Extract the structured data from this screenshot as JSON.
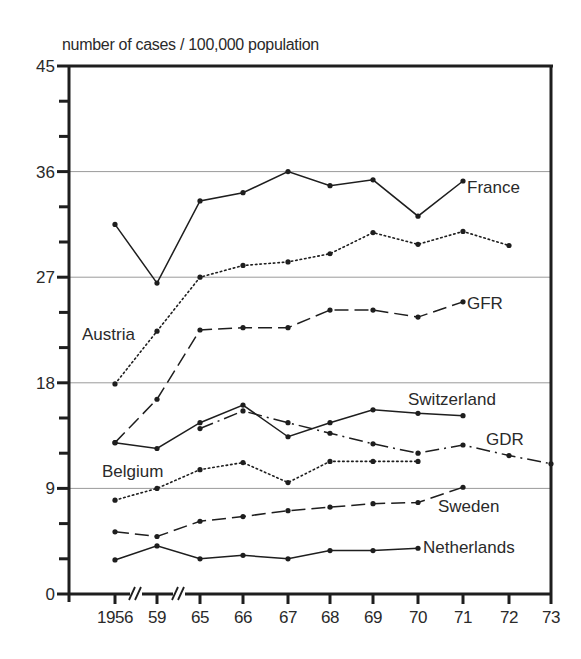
{
  "chart_data": {
    "type": "line",
    "title": "",
    "ylabel": "number of cases / 100,000 population",
    "xlabel": "",
    "ylim": [
      0,
      45
    ],
    "yticks": [
      0,
      9,
      18,
      27,
      36,
      45
    ],
    "y_minor_step": 3,
    "grid_lines_y": [
      9,
      18,
      27,
      36
    ],
    "x": [
      "1956",
      "59",
      "65",
      "66",
      "67",
      "68",
      "69",
      "70",
      "71",
      "72",
      "73"
    ],
    "x_breaks_after": [
      "1956",
      "59"
    ],
    "legend": "inline labels",
    "series": [
      {
        "name": "France",
        "style": "solid",
        "values": [
          31.5,
          26.5,
          33.5,
          34.2,
          36.0,
          34.8,
          35.3,
          32.2,
          35.2,
          null,
          null
        ]
      },
      {
        "name": "Austria",
        "style": "dotted",
        "values": [
          17.9,
          22.4,
          27.0,
          28.0,
          28.3,
          29.0,
          30.8,
          29.8,
          30.9,
          29.7,
          null
        ]
      },
      {
        "name": "GFR",
        "style": "dashed",
        "values": [
          12.9,
          16.6,
          22.5,
          22.7,
          22.7,
          24.2,
          24.2,
          23.6,
          24.9,
          null,
          null
        ]
      },
      {
        "name": "Switzerland",
        "style": "solid",
        "values": [
          12.9,
          12.4,
          14.6,
          16.1,
          13.4,
          14.6,
          15.7,
          15.4,
          15.2,
          null,
          null
        ]
      },
      {
        "name": "GDR",
        "style": "dash-dot",
        "values": [
          null,
          null,
          14.1,
          15.6,
          14.6,
          13.7,
          12.8,
          12.0,
          12.7,
          11.8,
          11.1
        ]
      },
      {
        "name": "Belgium",
        "style": "dotted",
        "values": [
          8.0,
          9.0,
          10.6,
          11.2,
          9.5,
          11.3,
          11.3,
          11.3,
          null,
          null,
          null
        ]
      },
      {
        "name": "Sweden",
        "style": "dashed",
        "values": [
          5.3,
          4.9,
          6.2,
          6.6,
          7.1,
          7.4,
          7.7,
          7.8,
          9.1,
          null,
          null
        ]
      },
      {
        "name": "Netherlands",
        "style": "solid",
        "values": [
          2.9,
          4.1,
          3.0,
          3.3,
          3.0,
          3.7,
          3.7,
          3.9,
          null,
          null,
          null
        ]
      }
    ]
  },
  "labels": {
    "ylabel": "number of cases / 100,000 population",
    "series": [
      {
        "name": "France",
        "x": 467,
        "y": 193
      },
      {
        "name": "Austria",
        "x": 82,
        "y": 340
      },
      {
        "name": "GFR",
        "x": 467,
        "y": 309
      },
      {
        "name": "Switzerland",
        "x": 408,
        "y": 405
      },
      {
        "name": "GDR",
        "x": 486,
        "y": 445
      },
      {
        "name": "Belgium",
        "x": 102,
        "y": 477
      },
      {
        "name": "Sweden",
        "x": 438,
        "y": 512
      },
      {
        "name": "Netherlands",
        "x": 423,
        "y": 553
      }
    ]
  },
  "colors": {
    "ink": "#1e1e1e",
    "grid": "#9a9a9a",
    "background": "#ffffff"
  }
}
